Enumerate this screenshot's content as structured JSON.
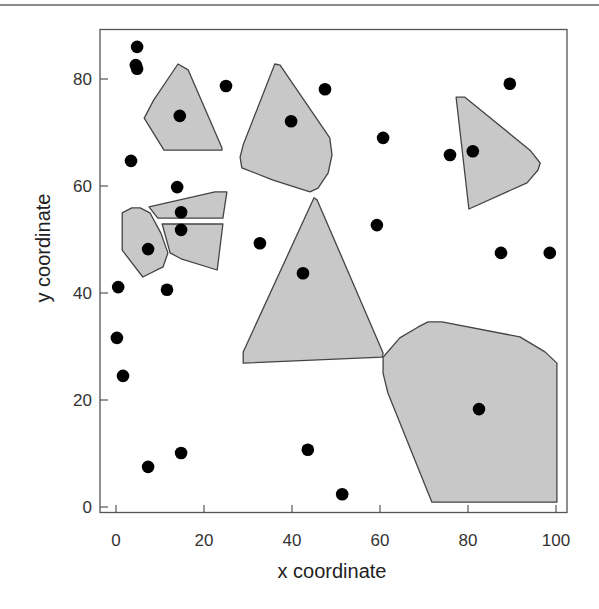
{
  "colors": {
    "polygon_fill": "#c8c8c8",
    "polygon_stroke": "#444444",
    "point": "#000000",
    "axis": "#555555",
    "top_rule": "#8a8a8a"
  },
  "chart_data": {
    "type": "scatter",
    "title": "",
    "xlabel": "x coordinate",
    "ylabel": "y coordinate",
    "xlim": [
      -4,
      102
    ],
    "ylim": [
      -1.5,
      89
    ],
    "xticks": [
      0,
      20,
      40,
      60,
      80,
      100
    ],
    "yticks": [
      0,
      20,
      40,
      60,
      80
    ],
    "xtick_labels": [
      "0",
      "20",
      "40",
      "60",
      "80",
      "100"
    ],
    "ytick_labels": [
      "0",
      "20",
      "40",
      "60",
      "80"
    ],
    "grid": false,
    "legend": null,
    "series": [
      {
        "name": "points",
        "type": "scatter",
        "points": [
          [
            4.8,
            86.0
          ],
          [
            4.5,
            82.6
          ],
          [
            4.8,
            81.9
          ],
          [
            14.5,
            73.1
          ],
          [
            25.0,
            78.7
          ],
          [
            3.4,
            64.7
          ],
          [
            13.9,
            59.8
          ],
          [
            14.8,
            55.1
          ],
          [
            14.8,
            51.8
          ],
          [
            7.3,
            48.2
          ],
          [
            0.5,
            41.1
          ],
          [
            11.6,
            40.6
          ],
          [
            0.2,
            31.6
          ],
          [
            1.6,
            24.5
          ],
          [
            7.3,
            7.5
          ],
          [
            14.8,
            10.1
          ],
          [
            39.8,
            72.1
          ],
          [
            47.5,
            78.1
          ],
          [
            32.7,
            49.3
          ],
          [
            42.5,
            43.7
          ],
          [
            59.3,
            52.7
          ],
          [
            60.7,
            69.0
          ],
          [
            43.6,
            10.7
          ],
          [
            51.4,
            2.4
          ],
          [
            75.9,
            65.8
          ],
          [
            81.1,
            66.5
          ],
          [
            89.5,
            79.1
          ],
          [
            87.5,
            47.5
          ],
          [
            98.6,
            47.5
          ],
          [
            82.5,
            18.3
          ]
        ]
      },
      {
        "name": "polygons",
        "type": "polygon",
        "polygons": [
          [
            [
              14.1,
              82.8
            ],
            [
              16.4,
              81.7
            ],
            [
              24.1,
              67.1
            ],
            [
              24.1,
              66.7
            ],
            [
              10.9,
              66.7
            ],
            [
              6.4,
              72.7
            ],
            [
              8.6,
              76.1
            ]
          ],
          [
            [
              7.5,
              56.1
            ],
            [
              22.5,
              58.9
            ],
            [
              25.2,
              58.9
            ],
            [
              24.3,
              54.0
            ],
            [
              9.5,
              54.0
            ]
          ],
          [
            [
              10.5,
              52.9
            ],
            [
              24.3,
              52.9
            ],
            [
              23.0,
              44.3
            ],
            [
              14.8,
              46.4
            ],
            [
              12.3,
              47.5
            ]
          ],
          [
            [
              1.4,
              55.0
            ],
            [
              3.6,
              55.9
            ],
            [
              5.5,
              55.9
            ],
            [
              7.7,
              55.0
            ],
            [
              10.2,
              51.2
            ],
            [
              11.8,
              47.5
            ],
            [
              10.7,
              44.9
            ],
            [
              6.1,
              43.0
            ],
            [
              1.4,
              48.0
            ]
          ],
          [
            [
              36.1,
              82.8
            ],
            [
              37.3,
              82.6
            ],
            [
              48.6,
              69.0
            ],
            [
              49.1,
              65.8
            ],
            [
              48.2,
              62.4
            ],
            [
              45.9,
              59.6
            ],
            [
              44.1,
              58.9
            ],
            [
              35.7,
              61.1
            ],
            [
              28.6,
              63.4
            ],
            [
              28.2,
              65.4
            ],
            [
              28.9,
              67.7
            ]
          ],
          [
            [
              45.0,
              57.8
            ],
            [
              45.7,
              57.4
            ],
            [
              60.7,
              28.8
            ],
            [
              60.5,
              28.0
            ],
            [
              28.9,
              26.9
            ],
            [
              28.9,
              29.0
            ]
          ],
          [
            [
              77.3,
              76.6
            ],
            [
              79.3,
              76.6
            ],
            [
              94.1,
              66.7
            ],
            [
              96.4,
              64.3
            ],
            [
              95.9,
              63.0
            ],
            [
              93.4,
              60.6
            ],
            [
              80.2,
              55.7
            ]
          ],
          [
            [
              70.9,
              34.6
            ],
            [
              74.1,
              34.6
            ],
            [
              91.8,
              31.8
            ],
            [
              97.5,
              29.0
            ],
            [
              100.2,
              26.9
            ],
            [
              100.2,
              0.9
            ],
            [
              71.8,
              0.9
            ],
            [
              61.8,
              21.3
            ],
            [
              60.7,
              25.0
            ],
            [
              60.7,
              28.0
            ],
            [
              64.5,
              31.6
            ],
            [
              68.6,
              33.6
            ]
          ]
        ]
      }
    ]
  }
}
